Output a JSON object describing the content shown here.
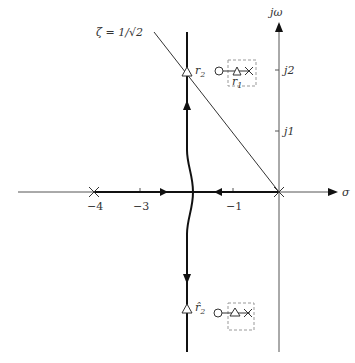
{
  "diagram": {
    "type": "root-locus",
    "axes": {
      "real_label": "σ",
      "imag_label": "jω",
      "real_ticks": [
        {
          "value": -4,
          "label": "−4"
        },
        {
          "value": -3,
          "label": "−3"
        },
        {
          "value": -1,
          "label": "−1"
        }
      ],
      "imag_ticks": [
        {
          "value": 1,
          "label": "j1"
        },
        {
          "value": 2,
          "label": "j2"
        }
      ]
    },
    "damping_line_label": "ζ = 1/√2",
    "poles": [
      {
        "s": "0",
        "label": ""
      },
      {
        "s": "-4",
        "label": ""
      }
    ],
    "markers": {
      "r2": "r",
      "r2_sub": "2",
      "r1": "r",
      "r1_sub": "1",
      "r2hat": "r̂",
      "r2hat_sub": "2"
    },
    "colors": {
      "axis": "#555555",
      "locus": "#111111",
      "dashed_box": "#999999"
    }
  }
}
